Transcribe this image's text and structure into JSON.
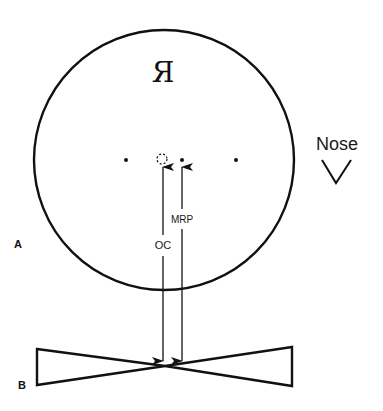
{
  "figure": {
    "panel_a_label": "A",
    "panel_b_label": "B",
    "glyph": "Я",
    "glyph_description": "mirrored R",
    "nose_label": "Nose",
    "oc_label": "OC",
    "mrp_label": "MRP"
  },
  "geometry": {
    "circle": {
      "cx": 164,
      "cy": 160,
      "r": 130
    },
    "dots": [
      {
        "cx": 126,
        "cy": 160
      },
      {
        "cx": 182,
        "cy": 160
      },
      {
        "cx": 236,
        "cy": 160
      }
    ],
    "dashed_circle": {
      "cx": 162,
      "cy": 159,
      "r": 5
    },
    "oc_arrow": {
      "x": 163,
      "y_top": 167,
      "y_bottom": 361
    },
    "mrp_arrow": {
      "x": 182,
      "y_top": 167,
      "y_bottom": 361
    },
    "bowtie": {
      "left_x": 37,
      "left_top": 349,
      "left_bottom": 385,
      "right_x": 292,
      "right_top": 347,
      "right_bottom": 386,
      "cross_x": 165,
      "cross_y": 366
    },
    "nose_v": {
      "x1": 322,
      "y1": 160,
      "x2": 336,
      "y2": 183,
      "x3": 351,
      "y3": 160
    }
  },
  "colors": {
    "stroke": "#111111",
    "background": "#ffffff"
  }
}
